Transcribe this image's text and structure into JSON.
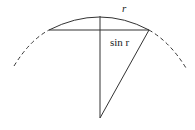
{
  "diagram": {
    "labels": {
      "arc": "r",
      "half_chord": "sin r"
    },
    "colors": {
      "stroke": "#333333",
      "background": "#ffffff"
    }
  }
}
